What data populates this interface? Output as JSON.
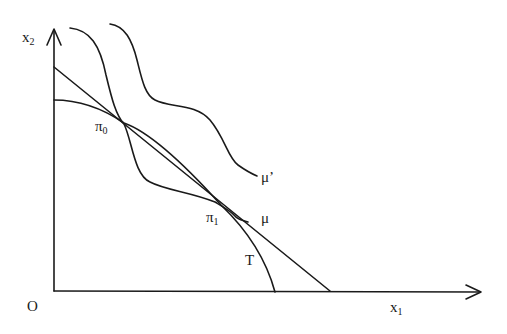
{
  "figure": {
    "type": "economics-diagram"
  },
  "axes": {
    "x": {
      "label": "x",
      "subscript": "1"
    },
    "y": {
      "label": "x",
      "subscript": "2"
    },
    "origin": "O"
  },
  "curves": [
    {
      "id": "T",
      "label": "T",
      "kind": "transformation-curve"
    },
    {
      "id": "mu",
      "label": "μ",
      "kind": "indifference-curve"
    },
    {
      "id": "mu_prime",
      "label": "μ’",
      "kind": "indifference-curve"
    },
    {
      "id": "price_line",
      "label": "",
      "kind": "straight-line"
    }
  ],
  "points": [
    {
      "id": "pi0",
      "label": "π",
      "subscript": "0"
    },
    {
      "id": "pi1",
      "label": "π",
      "subscript": "1"
    }
  ],
  "colors": {
    "ink": "#1a1a1a",
    "background": "#ffffff"
  }
}
